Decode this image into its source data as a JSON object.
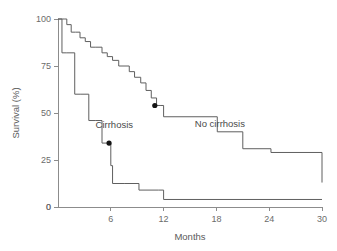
{
  "chart_data": {
    "type": "line",
    "title": "",
    "subtitle": "",
    "xlabel": "Months",
    "ylabel": "Survival (%)",
    "xlim": [
      0,
      30
    ],
    "ylim": [
      0,
      100
    ],
    "xticks": [
      0,
      6,
      12,
      18,
      24,
      30
    ],
    "xtick_labels": [
      "0",
      "6",
      "12",
      "18",
      "24",
      "30"
    ],
    "yticks": [
      0,
      25,
      50,
      75,
      100
    ],
    "ytick_labels": [
      "0",
      "25",
      "50",
      "75",
      "100"
    ],
    "grid": false,
    "legend_position": "inline-annotation",
    "step_style": "post",
    "series": [
      {
        "name": "No cirrhosis",
        "label": "No cirrhosis",
        "label_x": 18.4,
        "label_y": 42.5,
        "marker_point": {
          "x": 11.0,
          "y": 54.0
        },
        "x": [
          0.0,
          0.7,
          1.0,
          1.5,
          2.0,
          2.5,
          3.1,
          3.7,
          4.3,
          5.0,
          5.6,
          6.2,
          6.9,
          7.5,
          8.1,
          8.7,
          9.4,
          10.0,
          10.6,
          11.2,
          11.6,
          12.0,
          15.0,
          18.1,
          21.0,
          24.2,
          30.0
        ],
        "y": [
          100.0,
          100.0,
          97.0,
          93.0,
          93.0,
          90.0,
          88.0,
          85.0,
          85.0,
          82.0,
          80.0,
          78.0,
          75.0,
          75.0,
          72.0,
          69.0,
          66.0,
          62.0,
          58.0,
          54.0,
          54.0,
          48.0,
          48.0,
          40.0,
          31.0,
          29.0,
          13.0
        ]
      },
      {
        "name": "Cirrhosis",
        "label": "Cirrhosis",
        "label_x": 6.4,
        "label_y": 42.0,
        "marker_point": {
          "x": 5.8,
          "y": 34.0
        },
        "x": [
          0.0,
          0.45,
          1.0,
          1.9,
          2.6,
          3.5,
          4.3,
          5.0,
          5.8,
          6.0,
          6.2,
          7.6,
          9.2,
          11.4,
          12.0,
          30.0
        ],
        "y": [
          100.0,
          82.0,
          82.0,
          60.0,
          60.0,
          46.0,
          46.0,
          34.0,
          34.0,
          22.0,
          12.5,
          12.5,
          9.0,
          9.0,
          4.0,
          4.0
        ]
      }
    ],
    "annotations": [
      {
        "text": "Cirrhosis",
        "x": 6.4,
        "y": 42.0
      },
      {
        "text": "No cirrhosis",
        "x": 18.4,
        "y": 42.5
      }
    ]
  },
  "colors": {
    "background": "#ffffff",
    "axis": "#8c8c8c",
    "line": "#5f5f5f",
    "marker": "#141414",
    "text": "#5a5a5a"
  }
}
